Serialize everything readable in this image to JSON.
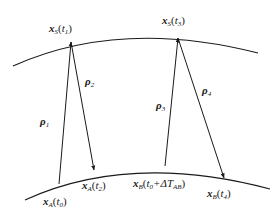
{
  "diagram": {
    "curves": {
      "upper": {
        "name": "satellite-orbit",
        "path": "M13,66 Q120,18 258,53"
      },
      "lower": {
        "name": "ground-track",
        "path": "M25,200 Q130,152 270,189"
      }
    },
    "vectors": [
      {
        "id": "rho1",
        "symbol": "ρ",
        "sub": "1",
        "from": [
          59,
          184
        ],
        "to": [
          71,
          42
        ],
        "label_pos": [
          40,
          116
        ]
      },
      {
        "id": "rho2",
        "symbol": "ρ",
        "sub": "2",
        "from": [
          71,
          42
        ],
        "to": [
          94,
          170
        ],
        "label_pos": [
          85,
          76
        ]
      },
      {
        "id": "rho3",
        "symbol": "ρ",
        "sub": "3",
        "from": [
          165,
          166
        ],
        "to": [
          178,
          38
        ],
        "label_pos": [
          156,
          100
        ]
      },
      {
        "id": "rho4",
        "symbol": "ρ",
        "sub": "4",
        "from": [
          178,
          38
        ],
        "to": [
          224,
          178
        ],
        "label_pos": [
          202,
          85
        ]
      }
    ],
    "points": [
      {
        "id": "xS_t1",
        "var": "x",
        "sub": "S",
        "arg": "t",
        "argsub": "1",
        "extra": "",
        "pos": [
          49,
          23
        ]
      },
      {
        "id": "xS_t3",
        "var": "x",
        "sub": "S",
        "arg": "t",
        "argsub": "3",
        "extra": "",
        "pos": [
          162,
          15
        ]
      },
      {
        "id": "xA_t0",
        "var": "x",
        "sub": "A",
        "arg": "t",
        "argsub": "0",
        "extra": "",
        "pos": [
          43,
          196
        ]
      },
      {
        "id": "xA_t2",
        "var": "x",
        "sub": "A",
        "arg": "t",
        "argsub": "2",
        "extra": "",
        "pos": [
          82,
          180
        ]
      },
      {
        "id": "xB_t0dT",
        "var": "x",
        "sub": "B",
        "arg": "t",
        "argsub": "0",
        "extra": "+ΔT",
        "extrasub": "AB",
        "pos": [
          133,
          178
        ]
      },
      {
        "id": "xB_t4",
        "var": "x",
        "sub": "B",
        "arg": "t",
        "argsub": "4",
        "extra": "",
        "pos": [
          207,
          188
        ]
      }
    ],
    "stroke_color": "#1a1a1a"
  }
}
